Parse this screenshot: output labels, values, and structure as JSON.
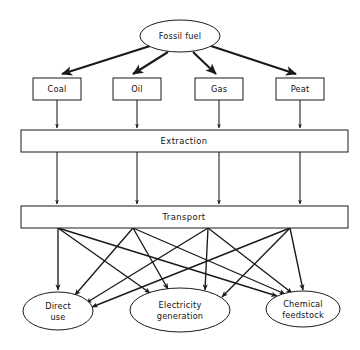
{
  "diagram": {
    "background_color": "#ffffff",
    "line_color": "#1a1a1a",
    "source": {
      "id": "fossil-fuel",
      "label": "Fossil fuel",
      "shape": "ellipse",
      "cx": 180,
      "cy": 36,
      "rx": 40,
      "ry": 16
    },
    "fuels": [
      {
        "id": "coal",
        "label": "Coal",
        "shape": "rect",
        "x": 33,
        "y": 78,
        "w": 48,
        "h": 22,
        "cx": 57
      },
      {
        "id": "oil",
        "label": "Oil",
        "shape": "rect",
        "x": 113,
        "y": 78,
        "w": 48,
        "h": 22,
        "cx": 137
      },
      {
        "id": "gas",
        "label": "Gas",
        "shape": "rect",
        "x": 195,
        "y": 78,
        "w": 48,
        "h": 22,
        "cx": 219
      },
      {
        "id": "peat",
        "label": "Peat",
        "shape": "rect",
        "x": 276,
        "y": 78,
        "w": 48,
        "h": 22,
        "cx": 300
      }
    ],
    "stages": [
      {
        "id": "extraction",
        "label": "Extraction",
        "shape": "bar",
        "x": 21,
        "y": 130,
        "w": 327,
        "h": 22
      },
      {
        "id": "transport",
        "label": "Transport",
        "shape": "bar",
        "x": 21,
        "y": 206,
        "w": 327,
        "h": 22
      }
    ],
    "uses": [
      {
        "id": "direct-use",
        "label_line1": "Direct",
        "label_line2": "use",
        "shape": "ellipse",
        "cx": 58,
        "cy": 311,
        "rx": 35,
        "ry": 19
      },
      {
        "id": "electricity-generation",
        "label_line1": "Electricity",
        "label_line2": "generation",
        "shape": "ellipse",
        "cx": 180,
        "cy": 310,
        "rx": 50,
        "ry": 22
      },
      {
        "id": "chemical-feedstock",
        "label_line1": "Chemical",
        "label_line2": "feedstock",
        "shape": "ellipse",
        "cx": 303,
        "cy": 309,
        "rx": 37,
        "ry": 18
      }
    ],
    "columns_x": [
      57,
      137,
      219,
      300
    ],
    "fan_origins_x": [
      58,
      133,
      208,
      290
    ],
    "edge_counts": {
      "source_to_fuels": 4,
      "fuels_to_extraction": 4,
      "extraction_to_transport": 4,
      "transport_to_uses": 12
    }
  }
}
